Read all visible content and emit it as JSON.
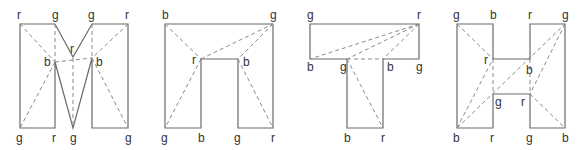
{
  "diagrams": [
    {
      "name": "M-shape",
      "outline": [
        [
          20,
          24
        ],
        [
          55,
          24
        ],
        [
          73,
          57
        ],
        [
          92,
          24
        ],
        [
          128,
          24
        ],
        [
          128,
          128
        ],
        [
          92,
          128
        ],
        [
          92,
          58
        ],
        [
          73,
          128
        ],
        [
          55,
          62
        ],
        [
          55,
          128
        ],
        [
          20,
          128
        ]
      ],
      "dashed": [
        [
          [
            20,
            24
          ],
          [
            55,
            62
          ]
        ],
        [
          [
            55,
            24
          ],
          [
            55,
            62
          ]
        ],
        [
          [
            55,
            62
          ],
          [
            20,
            128
          ]
        ],
        [
          [
            55,
            62
          ],
          [
            92,
            58
          ]
        ],
        [
          [
            73,
            58
          ],
          [
            73,
            128
          ]
        ],
        [
          [
            92,
            24
          ],
          [
            92,
            58
          ]
        ],
        [
          [
            128,
            24
          ],
          [
            92,
            58
          ]
        ],
        [
          [
            92,
            58
          ],
          [
            128,
            128
          ]
        ]
      ],
      "labels": [
        {
          "t": "r",
          "x": 17,
          "y": 19
        },
        {
          "t": "g",
          "x": 52,
          "y": 19
        },
        {
          "t": "g",
          "x": 88,
          "y": 19
        },
        {
          "t": "r",
          "x": 125,
          "y": 19
        },
        {
          "t": "r",
          "x": 70,
          "y": 53
        },
        {
          "t": "b",
          "x": 44,
          "y": 66
        },
        {
          "t": "b",
          "x": 96,
          "y": 66
        },
        {
          "t": "g",
          "x": 16,
          "y": 142
        },
        {
          "t": "r",
          "x": 52,
          "y": 142
        },
        {
          "t": "g",
          "x": 70,
          "y": 142
        },
        {
          "t": "g",
          "x": 125,
          "y": 142
        }
      ]
    },
    {
      "name": "n-shape",
      "outline": [
        [
          165,
          24
        ],
        [
          273,
          24
        ],
        [
          273,
          128
        ],
        [
          238,
          128
        ],
        [
          238,
          59
        ],
        [
          201,
          59
        ],
        [
          201,
          128
        ],
        [
          165,
          128
        ]
      ],
      "dashed": [
        [
          [
            165,
            24
          ],
          [
            201,
            59
          ]
        ],
        [
          [
            201,
            59
          ],
          [
            165,
            128
          ]
        ],
        [
          [
            201,
            59
          ],
          [
            273,
            24
          ]
        ],
        [
          [
            273,
            24
          ],
          [
            238,
            59
          ]
        ],
        [
          [
            238,
            59
          ],
          [
            273,
            128
          ]
        ]
      ],
      "labels": [
        {
          "t": "b",
          "x": 162,
          "y": 19
        },
        {
          "t": "g",
          "x": 270,
          "y": 19
        },
        {
          "t": "r",
          "x": 192,
          "y": 64
        },
        {
          "t": "b",
          "x": 243,
          "y": 66
        },
        {
          "t": "g",
          "x": 161,
          "y": 142
        },
        {
          "t": "b",
          "x": 198,
          "y": 142
        },
        {
          "t": "g",
          "x": 234,
          "y": 142
        },
        {
          "t": "r",
          "x": 271,
          "y": 142
        }
      ]
    },
    {
      "name": "T-shape",
      "outline": [
        [
          310,
          24
        ],
        [
          419,
          24
        ],
        [
          419,
          59
        ],
        [
          383,
          59
        ],
        [
          383,
          128
        ],
        [
          347,
          128
        ],
        [
          347,
          59
        ],
        [
          310,
          59
        ]
      ],
      "dashed": [
        [
          [
            419,
            24
          ],
          [
            310,
            59
          ]
        ],
        [
          [
            419,
            24
          ],
          [
            347,
            59
          ]
        ],
        [
          [
            419,
            24
          ],
          [
            383,
            59
          ]
        ],
        [
          [
            347,
            59
          ],
          [
            383,
            59
          ]
        ],
        [
          [
            347,
            59
          ],
          [
            383,
            128
          ]
        ]
      ],
      "labels": [
        {
          "t": "g",
          "x": 307,
          "y": 19
        },
        {
          "t": "r",
          "x": 417,
          "y": 19
        },
        {
          "t": "b",
          "x": 307,
          "y": 71
        },
        {
          "t": "g",
          "x": 340,
          "y": 71
        },
        {
          "t": "b",
          "x": 387,
          "y": 71
        },
        {
          "t": "g",
          "x": 416,
          "y": 71
        },
        {
          "t": "b",
          "x": 344,
          "y": 142
        },
        {
          "t": "r",
          "x": 381,
          "y": 142
        }
      ]
    },
    {
      "name": "H-shape",
      "outline": [
        [
          457,
          24
        ],
        [
          493,
          24
        ],
        [
          493,
          59
        ],
        [
          530,
          59
        ],
        [
          530,
          24
        ],
        [
          565,
          24
        ],
        [
          565,
          128
        ],
        [
          530,
          128
        ],
        [
          530,
          94
        ],
        [
          493,
          94
        ],
        [
          493,
          128
        ],
        [
          457,
          128
        ]
      ],
      "dashed": [
        [
          [
            457,
            24
          ],
          [
            493,
            59
          ]
        ],
        [
          [
            457,
            128
          ],
          [
            493,
            59
          ]
        ],
        [
          [
            457,
            128
          ],
          [
            565,
            24
          ]
        ],
        [
          [
            493,
            59
          ],
          [
            493,
            94
          ]
        ],
        [
          [
            530,
            59
          ],
          [
            530,
            94
          ]
        ],
        [
          [
            565,
            24
          ],
          [
            530,
            94
          ]
        ],
        [
          [
            530,
            94
          ],
          [
            565,
            128
          ]
        ]
      ],
      "labels": [
        {
          "t": "g",
          "x": 453,
          "y": 19
        },
        {
          "t": "b",
          "x": 490,
          "y": 19
        },
        {
          "t": "r",
          "x": 528,
          "y": 19
        },
        {
          "t": "g",
          "x": 562,
          "y": 19
        },
        {
          "t": "r",
          "x": 484,
          "y": 64
        },
        {
          "t": "b",
          "x": 526,
          "y": 74
        },
        {
          "t": "g",
          "x": 495,
          "y": 106
        },
        {
          "t": "r",
          "x": 521,
          "y": 106
        },
        {
          "t": "b",
          "x": 453,
          "y": 142
        },
        {
          "t": "r",
          "x": 490,
          "y": 142
        },
        {
          "t": "g",
          "x": 526,
          "y": 142
        },
        {
          "t": "b",
          "x": 562,
          "y": 142
        }
      ]
    }
  ]
}
